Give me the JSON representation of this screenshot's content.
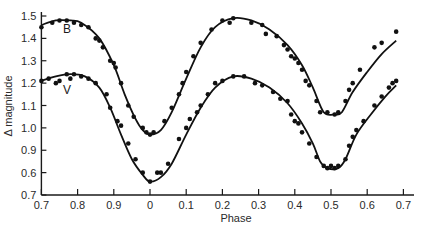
{
  "chart_data": {
    "type": "scatter",
    "title": "",
    "xlabel": "Phase",
    "ylabel": "Δ magnitude",
    "x_tick_labels": [
      "0.7",
      "0.8",
      "0.9",
      "0",
      "0.1",
      "0.2",
      "0.3",
      "0.4",
      "0.5",
      "0.6",
      "0.7"
    ],
    "x_tick_phase": [
      -0.3,
      -0.2,
      -0.1,
      0.0,
      0.1,
      0.2,
      0.3,
      0.4,
      0.5,
      0.6,
      0.7
    ],
    "y_tick_labels": [
      "1.5",
      "1.4",
      "1.3",
      "1.2",
      "1.1",
      "1.0",
      "0.9",
      "0.6",
      "0.7"
    ],
    "y_tick_values": [
      1.5,
      1.4,
      1.3,
      1.2,
      1.1,
      1.0,
      0.9,
      0.8,
      0.7
    ],
    "xlim": [
      -0.3,
      0.72
    ],
    "ylim": [
      0.7,
      1.5
    ],
    "grid": false,
    "legend": "inline labels (B, V) near left of curves",
    "series": [
      {
        "name": "B",
        "label_pos": [
          -0.24,
          1.44
        ],
        "curve": [
          [
            -0.3,
            1.46
          ],
          [
            -0.26,
            1.48
          ],
          [
            -0.22,
            1.48
          ],
          [
            -0.19,
            1.47
          ],
          [
            -0.14,
            1.4
          ],
          [
            -0.1,
            1.28
          ],
          [
            -0.07,
            1.15
          ],
          [
            -0.04,
            1.04
          ],
          [
            -0.02,
            0.99
          ],
          [
            0.0,
            0.97
          ],
          [
            0.03,
            0.99
          ],
          [
            0.06,
            1.07
          ],
          [
            0.1,
            1.22
          ],
          [
            0.14,
            1.36
          ],
          [
            0.18,
            1.45
          ],
          [
            0.23,
            1.49
          ],
          [
            0.28,
            1.48
          ],
          [
            0.33,
            1.44
          ],
          [
            0.38,
            1.37
          ],
          [
            0.42,
            1.28
          ],
          [
            0.45,
            1.18
          ],
          [
            0.48,
            1.07
          ],
          [
            0.51,
            1.06
          ],
          [
            0.53,
            1.07
          ],
          [
            0.56,
            1.16
          ],
          [
            0.6,
            1.25
          ],
          [
            0.64,
            1.33
          ],
          [
            0.68,
            1.39
          ]
        ],
        "points": [
          [
            -0.3,
            1.45
          ],
          [
            -0.27,
            1.47
          ],
          [
            -0.25,
            1.48
          ],
          [
            -0.23,
            1.48
          ],
          [
            -0.21,
            1.47
          ],
          [
            -0.19,
            1.46
          ],
          [
            -0.17,
            1.45
          ],
          [
            -0.15,
            1.4
          ],
          [
            -0.14,
            1.39
          ],
          [
            -0.13,
            1.36
          ],
          [
            -0.11,
            1.3
          ],
          [
            -0.1,
            1.29
          ],
          [
            -0.095,
            1.27
          ],
          [
            -0.08,
            1.2
          ],
          [
            -0.06,
            1.1
          ],
          [
            -0.045,
            1.05
          ],
          [
            -0.02,
            1.0
          ],
          [
            -0.01,
            0.98
          ],
          [
            0.0,
            0.97
          ],
          [
            0.01,
            0.98
          ],
          [
            0.04,
            1.03
          ],
          [
            0.06,
            1.09
          ],
          [
            0.08,
            1.15
          ],
          [
            0.09,
            1.2
          ],
          [
            0.1,
            1.25
          ],
          [
            0.12,
            1.32
          ],
          [
            0.14,
            1.38
          ],
          [
            0.17,
            1.44
          ],
          [
            0.2,
            1.48
          ],
          [
            0.23,
            1.49
          ],
          [
            0.22,
            1.47
          ],
          [
            0.28,
            1.47
          ],
          [
            0.31,
            1.46
          ],
          [
            0.32,
            1.42
          ],
          [
            0.35,
            1.41
          ],
          [
            0.37,
            1.37
          ],
          [
            0.38,
            1.35
          ],
          [
            0.39,
            1.32
          ],
          [
            0.4,
            1.31
          ],
          [
            0.41,
            1.29
          ],
          [
            0.42,
            1.26
          ],
          [
            0.43,
            1.21
          ],
          [
            0.44,
            1.19
          ],
          [
            0.46,
            1.12
          ],
          [
            0.47,
            1.07
          ],
          [
            0.49,
            1.07
          ],
          [
            0.51,
            1.06
          ],
          [
            0.52,
            1.07
          ],
          [
            0.54,
            1.12
          ],
          [
            0.55,
            1.17
          ],
          [
            0.56,
            1.2
          ],
          [
            0.58,
            1.26
          ],
          [
            0.62,
            1.36
          ],
          [
            0.64,
            1.38
          ],
          [
            0.68,
            1.43
          ]
        ]
      },
      {
        "name": "V",
        "label_pos": [
          -0.24,
          1.17
        ],
        "curve": [
          [
            -0.3,
            1.21
          ],
          [
            -0.26,
            1.23
          ],
          [
            -0.22,
            1.24
          ],
          [
            -0.18,
            1.23
          ],
          [
            -0.14,
            1.18
          ],
          [
            -0.11,
            1.09
          ],
          [
            -0.08,
            0.97
          ],
          [
            -0.05,
            0.86
          ],
          [
            -0.02,
            0.79
          ],
          [
            0.0,
            0.76
          ],
          [
            0.03,
            0.78
          ],
          [
            0.06,
            0.84
          ],
          [
            0.1,
            0.97
          ],
          [
            0.14,
            1.09
          ],
          [
            0.18,
            1.18
          ],
          [
            0.23,
            1.23
          ],
          [
            0.28,
            1.22
          ],
          [
            0.33,
            1.18
          ],
          [
            0.38,
            1.11
          ],
          [
            0.42,
            1.02
          ],
          [
            0.45,
            0.93
          ],
          [
            0.47,
            0.85
          ],
          [
            0.49,
            0.82
          ],
          [
            0.52,
            0.82
          ],
          [
            0.54,
            0.86
          ],
          [
            0.57,
            0.97
          ],
          [
            0.61,
            1.06
          ],
          [
            0.65,
            1.14
          ],
          [
            0.68,
            1.19
          ]
        ],
        "points": [
          [
            -0.3,
            1.21
          ],
          [
            -0.28,
            1.22
          ],
          [
            -0.26,
            1.2
          ],
          [
            -0.25,
            1.21
          ],
          [
            -0.23,
            1.24
          ],
          [
            -0.22,
            1.22
          ],
          [
            -0.21,
            1.24
          ],
          [
            -0.19,
            1.23
          ],
          [
            -0.17,
            1.22
          ],
          [
            -0.15,
            1.2
          ],
          [
            -0.12,
            1.15
          ],
          [
            -0.11,
            1.09
          ],
          [
            -0.09,
            1.03
          ],
          [
            -0.08,
            1.01
          ],
          [
            -0.06,
            0.93
          ],
          [
            -0.04,
            0.86
          ],
          [
            -0.02,
            0.8
          ],
          [
            0.0,
            0.76
          ],
          [
            0.02,
            0.8
          ],
          [
            0.03,
            0.8
          ],
          [
            0.05,
            0.84
          ],
          [
            0.08,
            0.95
          ],
          [
            0.1,
            1.0
          ],
          [
            0.11,
            1.04
          ],
          [
            0.13,
            1.07
          ],
          [
            0.14,
            1.1
          ],
          [
            0.16,
            1.15
          ],
          [
            0.18,
            1.2
          ],
          [
            0.2,
            1.21
          ],
          [
            0.23,
            1.23
          ],
          [
            0.26,
            1.23
          ],
          [
            0.29,
            1.2
          ],
          [
            0.31,
            1.19
          ],
          [
            0.34,
            1.16
          ],
          [
            0.36,
            1.13
          ],
          [
            0.38,
            1.12
          ],
          [
            0.39,
            1.06
          ],
          [
            0.4,
            1.03
          ],
          [
            0.41,
            1.02
          ],
          [
            0.42,
            0.98
          ],
          [
            0.44,
            0.93
          ],
          [
            0.46,
            0.87
          ],
          [
            0.48,
            0.83
          ],
          [
            0.49,
            0.82
          ],
          [
            0.5,
            0.83
          ],
          [
            0.51,
            0.82
          ],
          [
            0.52,
            0.83
          ],
          [
            0.54,
            0.86
          ],
          [
            0.55,
            0.92
          ],
          [
            0.56,
            0.96
          ],
          [
            0.57,
            0.99
          ],
          [
            0.59,
            1.03
          ],
          [
            0.62,
            1.1
          ],
          [
            0.64,
            1.14
          ],
          [
            0.66,
            1.18
          ],
          [
            0.67,
            1.2
          ],
          [
            0.68,
            1.21
          ]
        ]
      }
    ]
  }
}
